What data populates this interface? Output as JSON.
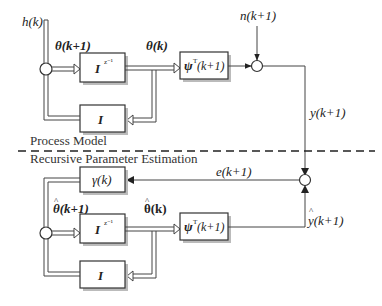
{
  "title_fragment": "",
  "process_model": {
    "section_label": "Process Model",
    "input_label": "h(k)",
    "noise_label": "n(k+1)",
    "theta_next_label": "θ(k+1)",
    "theta_label": "θ(k)",
    "delay_block": {
      "main": "I",
      "sup": "z⁻¹"
    },
    "feedback_block": "I",
    "regressor_block": {
      "psi": "ψ",
      "sup": "T",
      "arg": "(k+1)"
    },
    "output_label": "y(k+1)"
  },
  "estimation": {
    "section_label": "Recursive Parameter Estimation",
    "gain_block": "γ(k)",
    "error_label": "e(k+1)",
    "theta_hat_next_label": "θ(k+1)",
    "theta_hat_label": "θ(k)",
    "delay_block": {
      "main": "I",
      "sup": "z⁻¹"
    },
    "feedback_block": "I",
    "regressor_block": {
      "psi": "ψ",
      "sup": "T",
      "arg": "(k+1)"
    },
    "output_hat_label": "y(k+1)"
  }
}
